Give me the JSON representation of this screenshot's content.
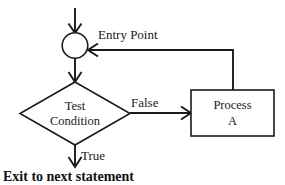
{
  "diagram": {
    "background_color": "#ffffff",
    "line_color": "#1a1a1a",
    "nodes": {
      "entry_junction": {
        "shape": "circle",
        "label": ""
      },
      "decision": {
        "shape": "diamond",
        "label_line1": "Test",
        "label_line2": "Condition"
      },
      "process": {
        "shape": "rectangle",
        "label_line1": "Process",
        "label_line2": "A"
      }
    },
    "edge_labels": {
      "entry_point": "Entry Point",
      "false_branch": "False",
      "true_branch": "True"
    },
    "exit_text": "Exit to next statement"
  }
}
